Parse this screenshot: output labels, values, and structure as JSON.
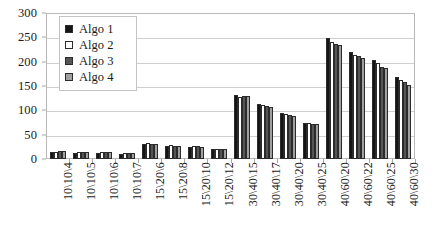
{
  "chart_data": {
    "type": "bar",
    "title": "",
    "xlabel": "",
    "ylabel": "",
    "ylim": [
      0,
      300
    ],
    "ytick_step": 50,
    "yticks": [
      0,
      50,
      100,
      150,
      200,
      250,
      300
    ],
    "grid": true,
    "legend_position": "inside-top-left",
    "categories": [
      "10\\10\\4",
      "10\\10\\5",
      "10\\10\\6",
      "10\\10\\7",
      "15\\20\\6",
      "15\\20\\8",
      "15\\20\\10",
      "15\\20\\12",
      "30\\40\\15",
      "30\\40\\17",
      "30\\40\\20",
      "30\\40\\25",
      "40\\60\\20",
      "40\\60\\22",
      "40\\60\\25",
      "40\\60\\30"
    ],
    "series": [
      {
        "name": "Algo 1",
        "color": "#151515",
        "values": [
          14,
          13,
          13,
          11,
          31,
          27,
          25,
          20,
          131,
          113,
          95,
          75,
          248,
          219,
          203,
          168
        ]
      },
      {
        "name": "Algo 2",
        "color": "#ffffff",
        "values": [
          15,
          14,
          14,
          12,
          32,
          28,
          26,
          21,
          128,
          110,
          92,
          73,
          240,
          214,
          197,
          163
        ]
      },
      {
        "name": "Algo 3",
        "color": "#565656",
        "values": [
          16,
          15,
          15,
          13,
          31,
          27,
          26,
          21,
          130,
          108,
          90,
          72,
          237,
          211,
          190,
          158
        ]
      },
      {
        "name": "Algo 4",
        "color": "#a0a0a0",
        "values": [
          16,
          15,
          15,
          13,
          30,
          27,
          25,
          20,
          129,
          107,
          88,
          71,
          234,
          208,
          186,
          153
        ]
      }
    ]
  },
  "legend": {
    "items": [
      {
        "label": "Algo 1"
      },
      {
        "label": "Algo 2"
      },
      {
        "label": "Algo 3"
      },
      {
        "label": "Algo 4"
      }
    ]
  }
}
